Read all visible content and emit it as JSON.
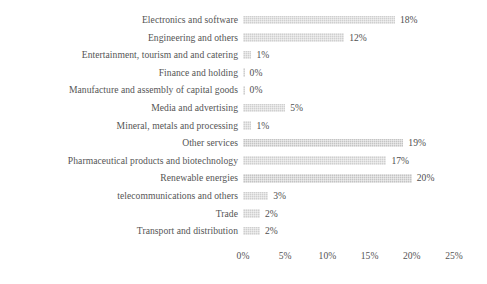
{
  "chart_data": {
    "type": "bar",
    "orientation": "horizontal",
    "title": "",
    "subtitle": "",
    "xlabel": "",
    "ylabel": "",
    "xlim": [
      0,
      25
    ],
    "grid": false,
    "legend": null,
    "value_suffix": "%",
    "xticks": [
      "0%",
      "5%",
      "10%",
      "15%",
      "20%",
      "25%"
    ],
    "xtick_values": [
      0,
      5,
      10,
      15,
      20,
      25
    ],
    "categories": [
      "Electronics and software",
      "Engineering and others",
      "Entertainment, tourism and and catering",
      "Finance and holding",
      "Manufacture and assembly of capital goods",
      "Media and advertising",
      "Mineral, metals and processing",
      "Other services",
      "Pharmaceutical products and biotechnology",
      "Renewable energies",
      "telecommunications and others",
      "Trade",
      "Transport and distribution"
    ],
    "values": [
      18,
      12,
      1,
      0,
      0,
      5,
      1,
      19,
      17,
      20,
      3,
      2,
      2
    ],
    "data_labels": [
      "18%",
      "12%",
      "1%",
      "0%",
      "0%",
      "5%",
      "1%",
      "19%",
      "17%",
      "20%",
      "3%",
      "2%",
      "2%"
    ],
    "colors": {
      "bar": "#cfcfcf",
      "bar_dark": "#c4c4c4",
      "text": "#555555",
      "background": "#ffffff"
    }
  }
}
